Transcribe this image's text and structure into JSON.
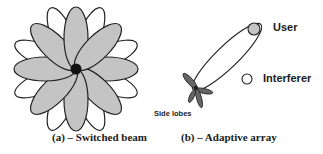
{
  "figure": {
    "panel_a": {
      "caption": "(a) – Switched beam",
      "center": [
        76,
        69
      ],
      "gray_petals": {
        "count": 8,
        "length": 62,
        "width": 12,
        "start_angle": 0,
        "fill": "#c4c4c4"
      },
      "white_petals": {
        "count": 8,
        "length": 66,
        "width": 11,
        "start_angle": 22.5,
        "fill": "#ffffff"
      },
      "hub_color": "#111111"
    },
    "panel_b": {
      "caption": "(b) – Adaptive array",
      "main_lobe": {
        "from": [
          196,
          88
        ],
        "to": [
          259,
          26
        ]
      },
      "side_lobes_label": "Side lobes",
      "user_label": "User",
      "interferer_label": "Interferer",
      "user_fill": "#c4c4c4",
      "side_lobe_fill": "#666666"
    }
  }
}
